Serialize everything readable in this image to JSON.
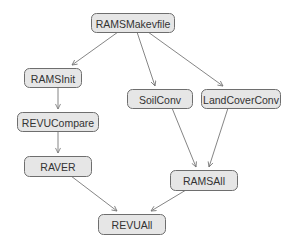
{
  "diagram": {
    "type": "flowchart",
    "colors": {
      "node_fill": "#e6e6e6",
      "node_stroke": "#6e6e6e",
      "edge": "#777777",
      "text": "#333333",
      "background": "#ffffff"
    },
    "nodes": [
      {
        "id": "RAMSMakevfile",
        "label": "RAMSMakevfile",
        "x": 91,
        "y": 13,
        "w": 83,
        "h": 19
      },
      {
        "id": "RAMSInit",
        "label": "RAMSInit",
        "x": 24,
        "y": 68,
        "w": 57,
        "h": 19
      },
      {
        "id": "SoilConv",
        "label": "SoilConv",
        "x": 127,
        "y": 89,
        "w": 65,
        "h": 19
      },
      {
        "id": "LandCoverConv",
        "label": "LandCoverConv",
        "x": 201,
        "y": 89,
        "w": 79,
        "h": 19
      },
      {
        "id": "REVUCompare",
        "label": "REVUCompare",
        "x": 17,
        "y": 112,
        "w": 81,
        "h": 19
      },
      {
        "id": "RAVER",
        "label": "RAVER",
        "x": 24,
        "y": 156,
        "w": 67,
        "h": 20
      },
      {
        "id": "RAMSAll",
        "label": "RAMSAll",
        "x": 170,
        "y": 170,
        "w": 67,
        "h": 20
      },
      {
        "id": "REVUAll",
        "label": "REVUAll",
        "x": 98,
        "y": 214,
        "w": 67,
        "h": 20
      }
    ],
    "edges": [
      {
        "from": "RAMSMakevfile",
        "to": "RAMSInit",
        "x1": 118,
        "y1": 32,
        "x2": 72,
        "y2": 65
      },
      {
        "from": "RAMSMakevfile",
        "to": "SoilConv",
        "x1": 137,
        "y1": 32,
        "x2": 155,
        "y2": 86
      },
      {
        "from": "RAMSMakevfile",
        "to": "LandCoverConv",
        "x1": 148,
        "y1": 32,
        "x2": 223,
        "y2": 86
      },
      {
        "from": "RAMSInit",
        "to": "REVUCompare",
        "x1": 58,
        "y1": 87,
        "x2": 58,
        "y2": 109
      },
      {
        "from": "REVUCompare",
        "to": "RAVER",
        "x1": 58,
        "y1": 131,
        "x2": 58,
        "y2": 153
      },
      {
        "from": "SoilConv",
        "to": "RAMSAll",
        "x1": 172,
        "y1": 108,
        "x2": 196,
        "y2": 167
      },
      {
        "from": "LandCoverConv",
        "to": "RAMSAll",
        "x1": 228,
        "y1": 108,
        "x2": 209,
        "y2": 167
      },
      {
        "from": "RAVER",
        "to": "REVUAll",
        "x1": 71,
        "y1": 176,
        "x2": 117,
        "y2": 211
      },
      {
        "from": "RAMSAll",
        "to": "REVUAll",
        "x1": 186,
        "y1": 190,
        "x2": 151,
        "y2": 211
      }
    ]
  }
}
